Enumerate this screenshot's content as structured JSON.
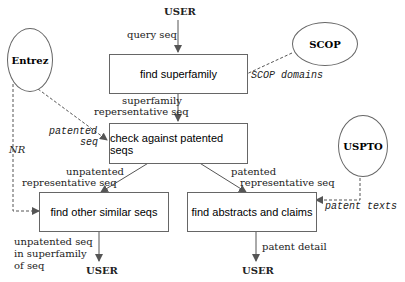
{
  "sources": {
    "user_top": "USER",
    "scop": "SCOP",
    "entrez": "Entrez",
    "uspto": "USPTO"
  },
  "boxes": {
    "find_superfamily": "find superfamily",
    "check_patented": "check against patented seqs",
    "find_similar": "find other similar seqs",
    "find_abstracts": "find abstracts and claims"
  },
  "edges": {
    "query_seq": "query seq",
    "scop_domains": "SCOP domains",
    "superfamily_line1": "superfamily",
    "superfamily_line2": "repersentative seq",
    "patented_seq_line1": "patented",
    "patented_seq_line2": "seq",
    "nr": "NR",
    "unpatented_line1": "unpatented",
    "unpatented_line2": "representative seq",
    "patented_rep_line1": "patented",
    "patented_rep_line2": "representative seq",
    "patent_texts": "patent texts",
    "out_left_line1": "unpatented seq",
    "out_left_line2": "in superfamily",
    "out_left_line3": "of seq",
    "patent_detail": "patent detail"
  },
  "outputs": {
    "user_left": "USER",
    "user_right": "USER"
  }
}
